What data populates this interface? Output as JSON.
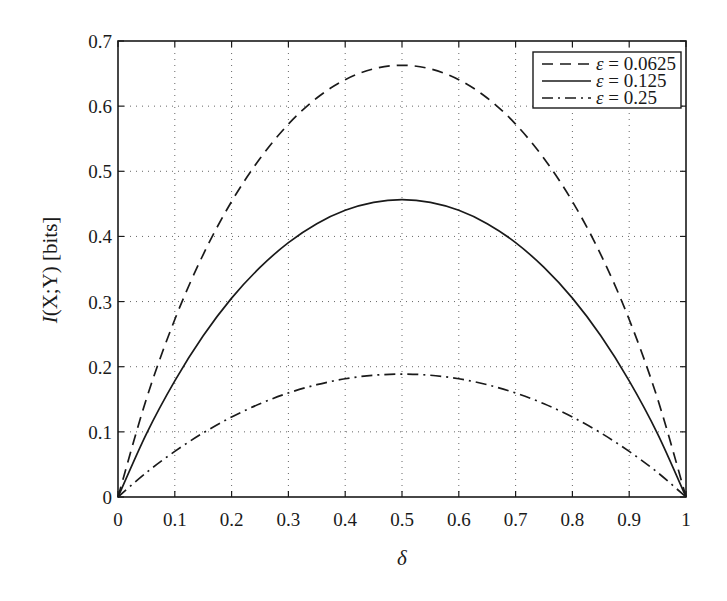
{
  "chart_data": {
    "type": "line",
    "title": "",
    "xlabel": "δ",
    "ylabel": "I(X;Y) [bits]",
    "ylabel_parts": {
      "func": "I",
      "args": "(X;Y)",
      "unit": " [bits]"
    },
    "xlim": [
      0,
      1
    ],
    "ylim": [
      0,
      0.7
    ],
    "xticks": [
      0,
      0.1,
      0.2,
      0.3,
      0.4,
      0.5,
      0.6,
      0.7,
      0.8,
      0.9,
      1
    ],
    "xtick_labels": [
      "0",
      "0.1",
      "0.2",
      "0.3",
      "0.4",
      "0.5",
      "0.6",
      "0.7",
      "0.8",
      "0.9",
      "1"
    ],
    "yticks": [
      0,
      0.1,
      0.2,
      0.3,
      0.4,
      0.5,
      0.6,
      0.7
    ],
    "ytick_labels": [
      "0",
      "0.1",
      "0.2",
      "0.3",
      "0.4",
      "0.5",
      "0.6",
      "0.7"
    ],
    "grid": true,
    "legend_position": "top-right",
    "x": [
      0,
      0.05,
      0.1,
      0.15,
      0.2,
      0.25,
      0.3,
      0.35,
      0.4,
      0.45,
      0.5,
      0.55,
      0.6,
      0.65,
      0.7,
      0.75,
      0.8,
      0.85,
      0.9,
      0.95,
      1
    ],
    "series": [
      {
        "name": "ε = 0.0625",
        "symbol": "ε",
        "value_label": "= 0.0625",
        "style": "dashed",
        "color": "#1a1a1a",
        "values": [
          0,
          0.1507,
          0.2725,
          0.3722,
          0.4537,
          0.5196,
          0.5724,
          0.6125,
          0.6406,
          0.6572,
          0.6627,
          0.6572,
          0.6406,
          0.6125,
          0.5724,
          0.5196,
          0.4537,
          0.3722,
          0.2725,
          0.1507,
          0
        ]
      },
      {
        "name": "ε = 0.125",
        "symbol": "ε",
        "value_label": "= 0.125",
        "style": "solid",
        "color": "#1a1a1a",
        "values": [
          0,
          0.097,
          0.1783,
          0.2474,
          0.3053,
          0.3524,
          0.3905,
          0.4196,
          0.4401,
          0.4523,
          0.4564,
          0.4523,
          0.4401,
          0.4196,
          0.3905,
          0.3524,
          0.3053,
          0.2474,
          0.1783,
          0.097,
          0
        ]
      },
      {
        "name": "ε = 0.25",
        "symbol": "ε",
        "value_label": "= 0.25",
        "style": "dashdot",
        "color": "#1a1a1a",
        "values": [
          0,
          0.0376,
          0.07,
          0.0984,
          0.1228,
          0.1431,
          0.1597,
          0.1724,
          0.1815,
          0.1869,
          0.1887,
          0.1869,
          0.1815,
          0.1724,
          0.1597,
          0.1431,
          0.1228,
          0.0984,
          0.07,
          0.0376,
          0
        ]
      }
    ]
  }
}
